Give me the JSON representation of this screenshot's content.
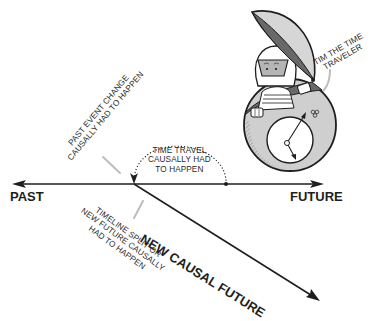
{
  "diagram": {
    "type": "timeline-diagram",
    "timeline": {
      "left_label": "PAST",
      "right_label": "FUTURE",
      "branch_label": "NEW CAUSAL FUTURE"
    },
    "annotations": {
      "past_event": [
        "PAST EVENT CHANGE",
        "CAUSALLY HAD TO HAPPEN"
      ],
      "time_travel": [
        "TIME TRAVEL",
        "CAUSALLY HAD",
        "TO HAPPEN"
      ],
      "timeline_split": [
        "TIMELINE SPLIT OR",
        "NEW FUTURE CAUSALLY",
        "HAD TO HAPPEN"
      ],
      "character": [
        "TIM THE TIME",
        "TRAVELER"
      ]
    },
    "character": {
      "name": "Tim the Time Traveler",
      "vehicle": "spherical time machine pod with open lid and clock dial"
    },
    "colors": {
      "ink": "#1e1e1e",
      "shell_light": "#c9c9c9",
      "shell_dark": "#6e6e6e",
      "leader_line": "#bdbdbd",
      "background": "#ffffff"
    }
  }
}
